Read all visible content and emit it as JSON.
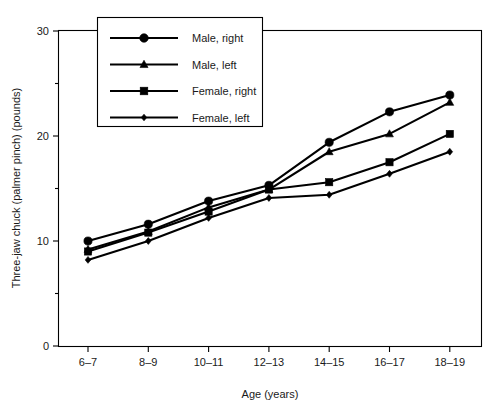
{
  "chart_data": {
    "type": "line",
    "title": "",
    "xlabel": "Age (years)",
    "ylabel": "Three-jaw chuck (palmer pinch) (pounds)",
    "categories": [
      "6–7",
      "8–9",
      "10–11",
      "12–13",
      "14–15",
      "16–17",
      "18–19"
    ],
    "ylim": [
      0,
      30
    ],
    "yticks": [
      0,
      10,
      20,
      30
    ],
    "ytick_labels": [
      "0",
      "10",
      "20",
      "30"
    ],
    "yminor_ticks": [
      5,
      15,
      25
    ],
    "grid": false,
    "legend_position": "top-center",
    "series": [
      {
        "name": "Male, right",
        "marker": "circle",
        "values": [
          10.0,
          11.6,
          13.8,
          15.3,
          19.4,
          22.3,
          23.9
        ]
      },
      {
        "name": "Male, left",
        "marker": "triangle",
        "values": [
          9.2,
          10.9,
          13.2,
          14.9,
          18.5,
          20.2,
          23.2
        ]
      },
      {
        "name": "Female, right",
        "marker": "square",
        "values": [
          9.0,
          10.8,
          12.8,
          14.9,
          15.6,
          17.5,
          20.2
        ]
      },
      {
        "name": "Female, left",
        "marker": "diamond",
        "values": [
          8.2,
          10.0,
          12.2,
          14.1,
          14.4,
          16.4,
          18.5
        ]
      }
    ]
  },
  "legend": {
    "entries": [
      {
        "label": "Male, right",
        "marker": "circle-marker"
      },
      {
        "label": "Male, left",
        "marker": "triangle-marker"
      },
      {
        "label": "Female, right",
        "marker": "square-marker"
      },
      {
        "label": "Female, left",
        "marker": "diamond-marker"
      }
    ]
  },
  "colors": {
    "line": "#000000",
    "marker": "#000000",
    "axis": "#000000",
    "background": "#ffffff"
  }
}
